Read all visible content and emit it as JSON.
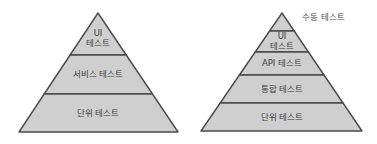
{
  "diagram": {
    "title": "",
    "pyramids": [
      {
        "name": "basic-test-pyramid",
        "tiers_top_to_bottom": [
          {
            "lines": [
              "UI",
              "테스트"
            ]
          },
          {
            "lines": [
              "서비스 테스트"
            ]
          },
          {
            "lines": [
              "단위 테스트"
            ]
          }
        ]
      },
      {
        "name": "extended-test-pyramid",
        "apex_label": "수동 테스트",
        "tiers_top_to_bottom": [
          {
            "lines": []
          },
          {
            "lines": [
              "UI",
              "테스트"
            ]
          },
          {
            "lines": [
              "API 테스트"
            ]
          },
          {
            "lines": [
              "통합 테스트"
            ]
          },
          {
            "lines": [
              "단위 테스트"
            ]
          }
        ]
      }
    ],
    "colors": {
      "tier_fill": "#cfcfcf",
      "outline": "#4a4a4a",
      "text": "#3c3c3c"
    }
  }
}
